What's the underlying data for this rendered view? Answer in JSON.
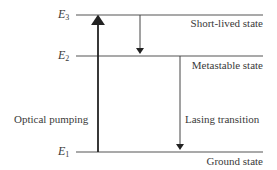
{
  "diagram": {
    "levels": [
      {
        "id": "E3",
        "symbol": "E",
        "subscript": "3",
        "state_label": "Short-lived state",
        "y": 15
      },
      {
        "id": "E2",
        "symbol": "E",
        "subscript": "2",
        "state_label": "Metastable state",
        "y": 56
      },
      {
        "id": "E1",
        "symbol": "E",
        "subscript": "1",
        "state_label": "Ground state",
        "y": 152
      }
    ],
    "transitions": [
      {
        "id": "pump",
        "from": "E1",
        "to": "E3",
        "direction": "up",
        "label": "Optical pumping"
      },
      {
        "id": "decay",
        "from": "E3",
        "to": "E2",
        "direction": "down",
        "label": ""
      },
      {
        "id": "lasing",
        "from": "E2",
        "to": "E1",
        "direction": "down",
        "label": "Lasing transition"
      }
    ],
    "colors": {
      "line": "#555555",
      "arrow": "#222222",
      "text": "#3a3a3a"
    }
  }
}
